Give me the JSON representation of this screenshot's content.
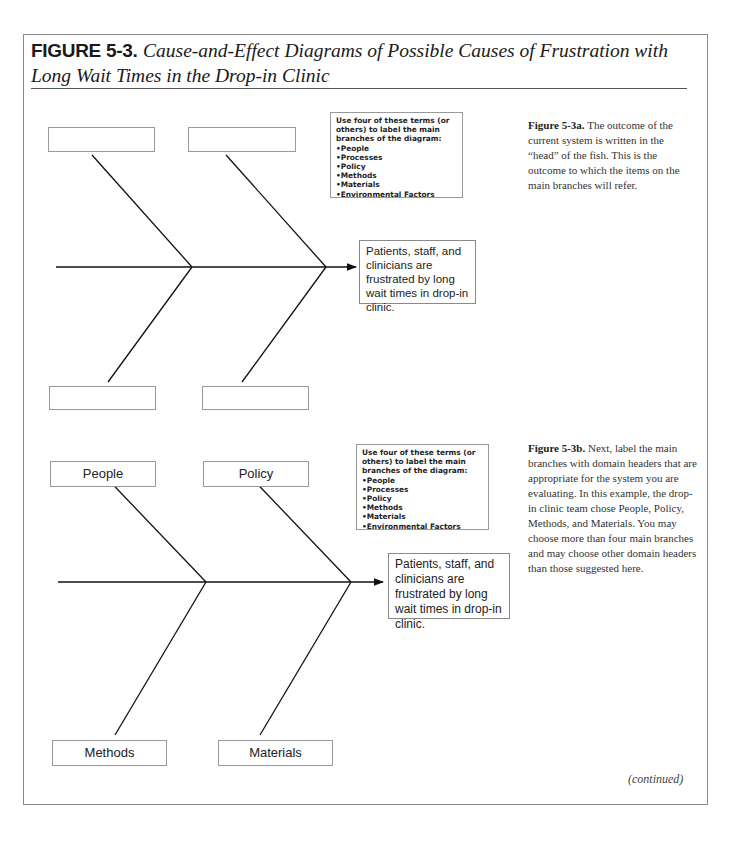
{
  "figure": {
    "label": "FIGURE 5-3.",
    "title": "Cause-and-Effect Diagrams of Possible Causes of Frustration with Long Wait Times in the Drop-in Clinic",
    "continued": "(continued)"
  },
  "diagram_a": {
    "branch_labels": [
      "",
      "",
      "",
      ""
    ],
    "terms_box": {
      "intro": "Use four of these terms (or others) to label the main branches of the diagram:",
      "items": [
        "People",
        "Processes",
        "Policy",
        "Methods",
        "Materials",
        "Environmental Factors"
      ]
    },
    "head": "Patients, staff, and clinicians are frustrated by long wait times in drop-in clinic.",
    "caption_label": "Figure 5-3a.",
    "caption_text": " The outcome of the current system is written in the “head” of the fish. This is the outcome to which the items on the main branches will refer."
  },
  "diagram_b": {
    "branch_labels": [
      "People",
      "Policy",
      "Methods",
      "Materials"
    ],
    "terms_box": {
      "intro": "Use four of these terms (or others) to label the main branches of the diagram:",
      "items": [
        "People",
        "Processes",
        "Policy",
        "Methods",
        "Materials",
        "Environmental Factors"
      ]
    },
    "head": "Patients, staff, and clinicians are frustrated by long wait times in drop-in clinic.",
    "caption_label": "Figure 5-3b.",
    "caption_text": " Next, label the main branches with domain headers that are appropriate for the system you are evaluating. In this example, the drop-in clinic team chose People, Policy, Methods, and Materials. You may choose more than four main branches and may choose other domain headers than those suggested here."
  }
}
